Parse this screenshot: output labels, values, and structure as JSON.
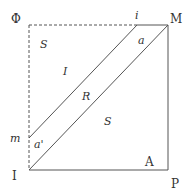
{
  "diagram": {
    "colors": {
      "line": "#555555",
      "text": "#333333",
      "background": "#ffffff"
    },
    "points": {
      "Phi": {
        "label": "Φ",
        "x": 17,
        "y": 19
      },
      "M": {
        "label": "M",
        "x": 174,
        "y": 21
      },
      "I": {
        "label": "I",
        "x": 16,
        "y": 181
      },
      "P": {
        "label": "P",
        "x": 175,
        "y": 187
      },
      "i": {
        "label": "i",
        "x": 138,
        "y": 18
      },
      "m": {
        "label": "m",
        "x": 14,
        "y": 140
      }
    },
    "regions": {
      "S_top": {
        "label": "S",
        "x": 43,
        "y": 46
      },
      "I_region": {
        "label": "I",
        "x": 65,
        "y": 73
      },
      "R": {
        "label": "R",
        "x": 86,
        "y": 100
      },
      "S_bottom": {
        "label": "S",
        "x": 106,
        "y": 123
      },
      "a": {
        "label": "a",
        "x": 140,
        "y": 42
      },
      "a_prime": {
        "label": "a'",
        "x": 37,
        "y": 146
      },
      "A": {
        "label": "A",
        "x": 149,
        "y": 164
      }
    },
    "lines": {
      "top_dashed": {
        "x1": 29,
        "y1": 25,
        "x2": 137,
        "y2": 25,
        "style": "dashed"
      },
      "top_solid": {
        "x1": 137,
        "y1": 25,
        "x2": 168,
        "y2": 25,
        "style": "solid"
      },
      "left_dashed": {
        "x1": 29,
        "y1": 25,
        "x2": 29,
        "y2": 170,
        "style": "dashed"
      },
      "right_edge": {
        "x1": 168,
        "y1": 25,
        "x2": 168,
        "y2": 170,
        "style": "solid"
      },
      "bottom_edge": {
        "x1": 29,
        "y1": 170,
        "x2": 168,
        "y2": 170,
        "style": "solid"
      },
      "diagonal_inner": {
        "x1": 137,
        "y1": 25,
        "x2": 29,
        "y2": 138,
        "style": "solid"
      },
      "diagonal_main": {
        "x1": 168,
        "y1": 25,
        "x2": 29,
        "y2": 170,
        "style": "solid"
      }
    }
  }
}
